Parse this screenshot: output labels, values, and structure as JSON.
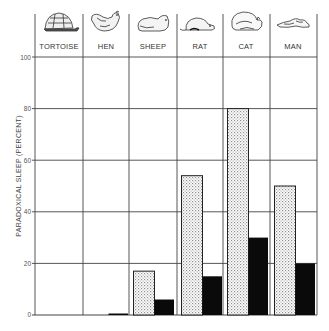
{
  "chart_data": {
    "type": "bar",
    "title": "",
    "categories": [
      "TORTOISE",
      "HEN",
      "SHEEP",
      "RAT",
      "CAT",
      "MAN"
    ],
    "series": [
      {
        "name": "paradoxical sleep (stippled)",
        "pattern": "stipple",
        "values": [
          0,
          0,
          17,
          54,
          80,
          50
        ]
      },
      {
        "name": "paradoxical sleep (solid)",
        "pattern": "solid",
        "values": [
          0,
          0.5,
          6,
          15,
          30,
          20
        ]
      }
    ],
    "xlabel": "",
    "ylabel": "PARADOXICAL SLEEP (PERCENT)",
    "ylim": [
      0,
      100
    ],
    "yticks": [
      0,
      20,
      40,
      60,
      80,
      100
    ],
    "grid": true,
    "legend": "none",
    "header_icons": [
      "tortoise-icon",
      "hen-icon",
      "sheep-icon",
      "rat-icon",
      "cat-icon",
      "man-icon"
    ]
  },
  "header": {
    "labels": [
      "TORTOISE",
      "HEN",
      "SHEEP",
      "RAT",
      "CAT",
      "MAN"
    ]
  },
  "axis": {
    "ylabel": "PARADOXICAL SLEEP (PERCENT)",
    "ticks": [
      "0",
      "20",
      "40",
      "60",
      "80",
      "100"
    ]
  },
  "colors": {
    "line": "#333333",
    "solid_bar": "#0a0a0a",
    "stipple_dot": "#9a9a9a",
    "background": "#ffffff"
  }
}
